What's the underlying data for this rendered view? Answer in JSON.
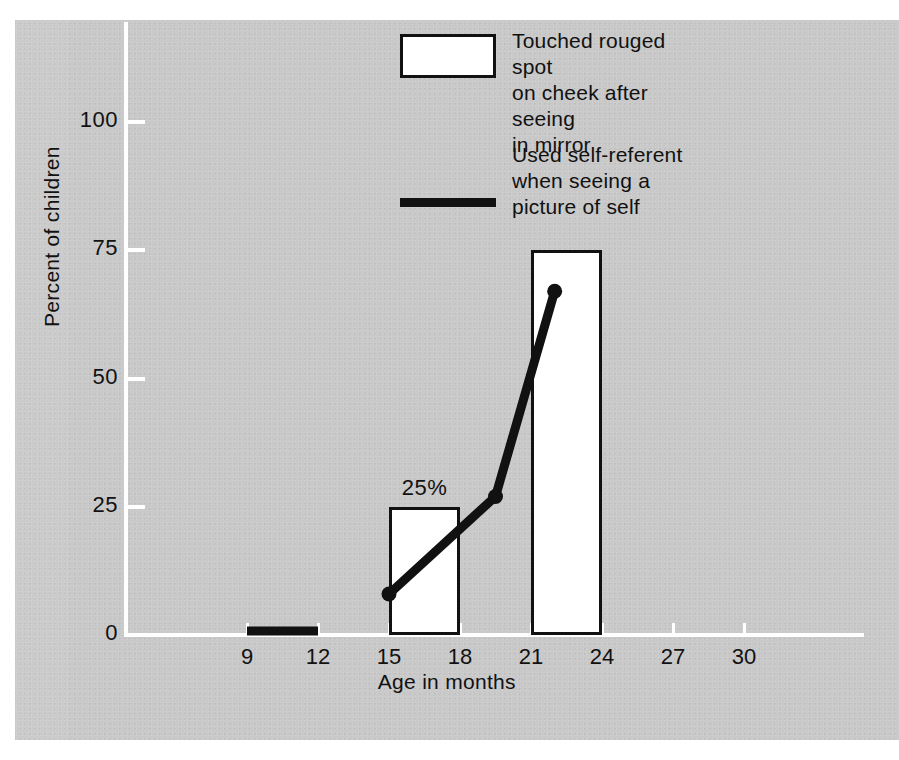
{
  "chart_data": {
    "type": "bar",
    "title": "",
    "xlabel": "Age in months",
    "ylabel": "Percent of children",
    "xlim": [
      6,
      33
    ],
    "ylim": [
      0,
      112
    ],
    "xticks": [
      "9",
      "12",
      "15",
      "18",
      "21",
      "24",
      "27",
      "30"
    ],
    "yticks": [
      "0",
      "25",
      "50",
      "75",
      "100"
    ],
    "grid": false,
    "legend_position": "top-center",
    "series": [
      {
        "name": "Touched rouged spot on cheek after seeing in mirror",
        "type": "bar",
        "style": "white-fill-black-outline",
        "bins": [
          {
            "x_start": 15,
            "x_end": 18,
            "value": 25,
            "label": "25%"
          },
          {
            "x_start": 21,
            "x_end": 24,
            "value": 75,
            "label": ""
          }
        ]
      },
      {
        "name": "Used self-referent when seeing a picture of self",
        "type": "line",
        "style": "thick-black-line-with-dots",
        "points": [
          {
            "x": 9,
            "y": 0,
            "marker": false
          },
          {
            "x": 12,
            "y": 0,
            "marker": false
          },
          {
            "x": 15,
            "y": 8,
            "marker": true
          },
          {
            "x": 19.5,
            "y": 27,
            "marker": true
          },
          {
            "x": 22,
            "y": 67,
            "marker": true
          }
        ]
      }
    ],
    "annotations": [
      {
        "text": "25%",
        "x": 16.5,
        "y": 25,
        "placement": "above-bar"
      }
    ]
  },
  "legend": {
    "entries": [
      {
        "swatch": "white-rectangle-outline",
        "lines": [
          "Touched rouged spot",
          "on cheek after seeing",
          "in mirror"
        ]
      },
      {
        "swatch": "thick-black-line",
        "lines": [
          "Used self-referent",
          "when seeing a",
          "picture of self"
        ]
      }
    ]
  },
  "axes": {
    "x_label": "Age in months",
    "y_label": "Percent of children",
    "x_tick_labels": [
      "9",
      "12",
      "15",
      "18",
      "21",
      "24",
      "27",
      "30"
    ],
    "y_tick_labels": [
      "0",
      "25",
      "50",
      "75",
      "100"
    ]
  },
  "colors": {
    "panel_background": "#c9c9c9",
    "ink": "#111111",
    "axis": "#ffffff",
    "bar_fill": "#ffffff",
    "page_background": "#ffffff"
  }
}
